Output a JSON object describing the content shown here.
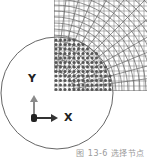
{
  "figure": {
    "caption": "图 13-6 选择节点",
    "axes": {
      "x_label": "X",
      "y_label": "Y"
    },
    "colors": {
      "circle": "#555555",
      "mesh_line": "#777777",
      "selected_node": "#555555",
      "y_arrow": "#8a8a8a",
      "x_arrow": "#333333",
      "caption": "#9a9a9a"
    }
  }
}
